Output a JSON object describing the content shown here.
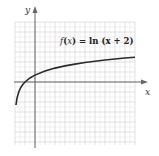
{
  "chart_data": {
    "type": "line",
    "title": "f(x) = ln (x + 2)",
    "title_parts": {
      "f": "f",
      "open": "(",
      "x": "x",
      "mid": ") = ",
      "ln": "ln",
      "arg": " (x + 2)"
    },
    "xlabel": "x",
    "ylabel": "y",
    "xlim": [
      -2,
      10
    ],
    "ylim": [
      -6.3,
      6
    ],
    "grid": true,
    "grid_minor_step": 0.5,
    "grid_major_step": 1,
    "series": [
      {
        "name": "f(x) = ln (x + 2)",
        "function": "ln(x+2)",
        "x": [
          -1.9,
          -1.8,
          -1.6,
          -1.4,
          -1.2,
          -1,
          -0.5,
          0,
          1,
          2,
          3,
          4,
          5,
          6,
          7,
          8,
          9,
          10
        ],
        "values": [
          -2.303,
          -1.609,
          -0.916,
          -0.511,
          -0.223,
          0,
          0.405,
          0.693,
          1.099,
          1.386,
          1.609,
          1.792,
          1.946,
          2.079,
          2.197,
          2.303,
          2.398,
          2.485
        ]
      }
    ],
    "colors": {
      "curve": "#2a2a2a",
      "axis": "#666666",
      "grid_major": "#cfcfcf",
      "grid_minor": "#e6e6e6"
    }
  }
}
